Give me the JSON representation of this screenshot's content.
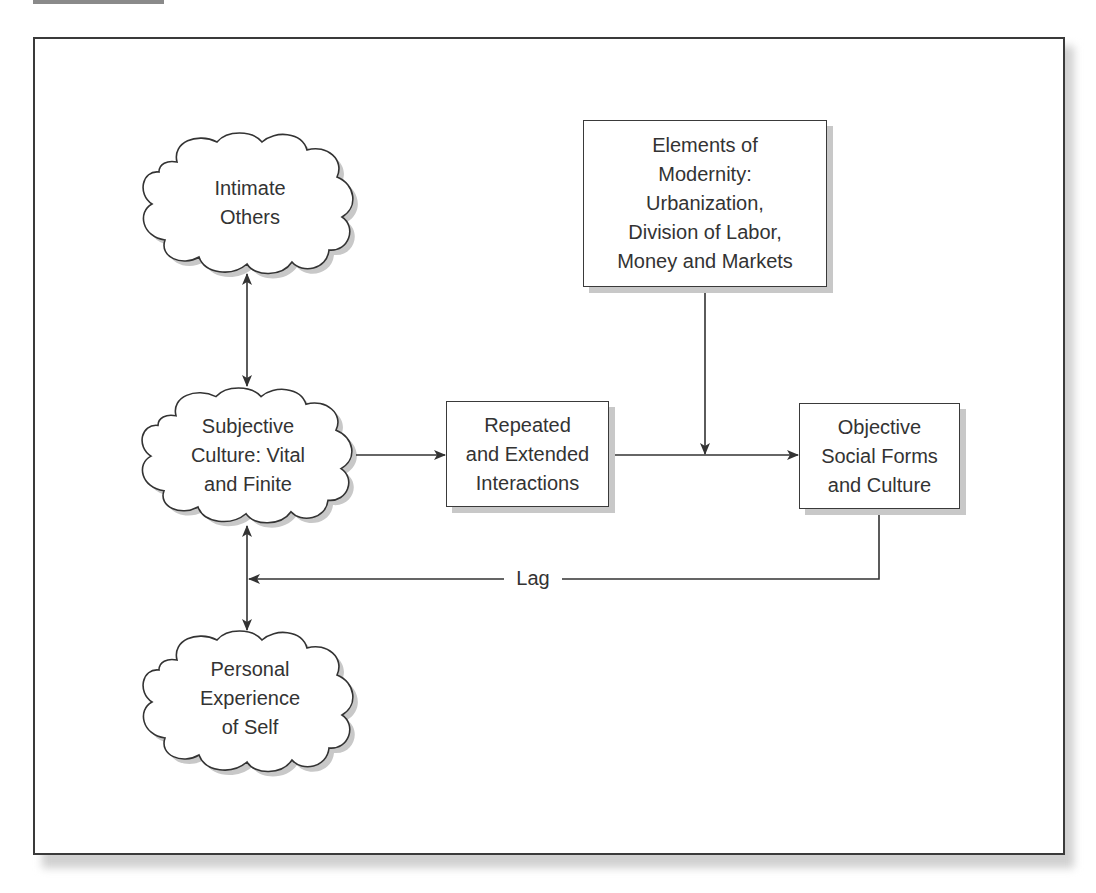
{
  "figure": {
    "tab_color": "#8a8a8a",
    "frame_border_color": "#3a3a3a",
    "text_color": "#333333"
  },
  "nodes": {
    "intimate_others": {
      "shape": "cloud",
      "lines": [
        "Intimate",
        "Others"
      ]
    },
    "subjective_culture": {
      "shape": "cloud",
      "lines": [
        "Subjective",
        "Culture: Vital",
        "and Finite"
      ]
    },
    "personal_experience": {
      "shape": "cloud",
      "lines": [
        "Personal",
        "Experience",
        "of Self"
      ]
    },
    "elements_of_modernity": {
      "shape": "box",
      "lines": [
        "Elements of",
        "Modernity:",
        "Urbanization,",
        "Division of Labor,",
        "Money and Markets"
      ]
    },
    "repeated_interactions": {
      "shape": "box",
      "lines": [
        "Repeated",
        "and Extended",
        "Interactions"
      ]
    },
    "objective_forms": {
      "shape": "box",
      "lines": [
        "Objective",
        "Social Forms",
        "and Culture"
      ]
    }
  },
  "edges": [
    {
      "from": "intimate_others",
      "to": "subjective_culture",
      "type": "bidirectional"
    },
    {
      "from": "subjective_culture",
      "to": "personal_experience",
      "type": "bidirectional"
    },
    {
      "from": "subjective_culture",
      "to": "repeated_interactions",
      "type": "directed"
    },
    {
      "from": "repeated_interactions",
      "to": "objective_forms",
      "type": "directed"
    },
    {
      "from": "elements_of_modernity",
      "to": "repeated_interactions->objective_forms",
      "type": "directed"
    },
    {
      "from": "objective_forms",
      "to": "subjective_culture",
      "type": "directed",
      "label": "Lag"
    }
  ],
  "labels": {
    "lag": "Lag"
  }
}
